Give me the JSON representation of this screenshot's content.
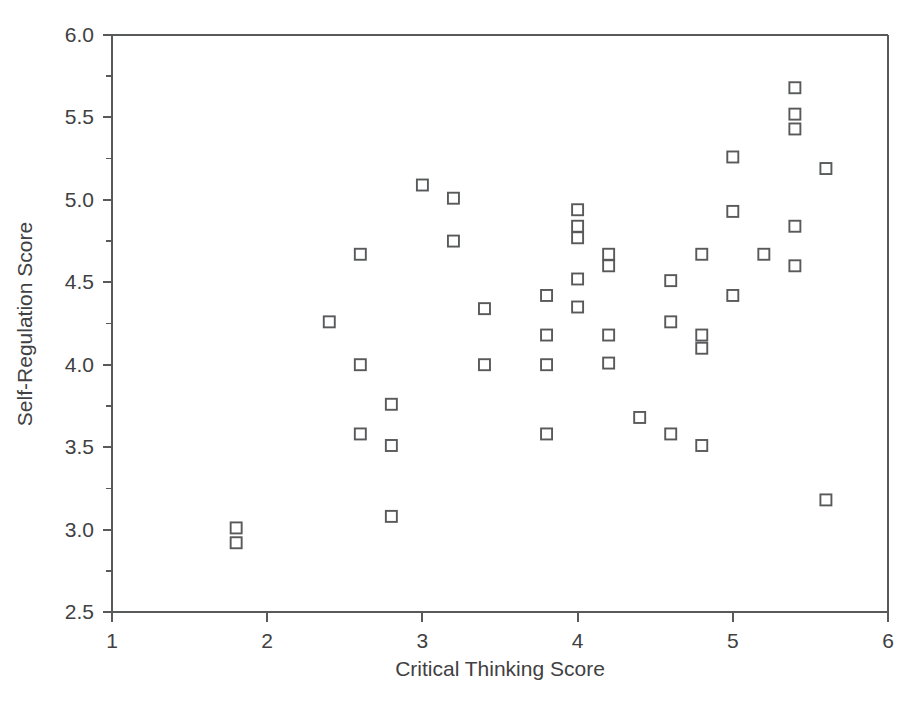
{
  "chart_data": {
    "type": "scatter",
    "title": "",
    "xlabel": "Critical Thinking Score",
    "ylabel": "Self-Regulation Score",
    "xlim": [
      1,
      6
    ],
    "ylim": [
      2.5,
      6.0
    ],
    "x_ticks": [
      "1",
      "2",
      "3",
      "4",
      "5",
      "6"
    ],
    "x_tick_values": [
      1,
      2,
      3,
      4,
      5,
      6
    ],
    "y_ticks": [
      "2.5",
      "3.0",
      "3.5",
      "4.0",
      "4.5",
      "5.0",
      "5.5",
      "6.0"
    ],
    "y_tick_values": [
      2.5,
      3.0,
      3.5,
      4.0,
      4.5,
      5.0,
      5.5,
      6.0
    ],
    "y_minor_tick_values": [
      2.75,
      3.25,
      3.75,
      4.25,
      4.75,
      5.25,
      5.75
    ],
    "grid": false,
    "legend": "none",
    "marker": "open-square",
    "marker_color": "#58595b",
    "marker_fill": "#ffffff",
    "axis_color": "#58595b",
    "point_count": 52,
    "x": [
      1.8,
      1.8,
      2.4,
      2.6,
      2.6,
      2.8,
      2.8,
      2.8,
      3.0,
      3.2,
      3.2,
      3.4,
      3.4,
      3.8,
      3.8,
      3.8,
      3.8,
      4.0,
      4.0,
      4.0,
      4.0,
      4.0,
      4.2,
      4.2,
      4.2,
      4.2,
      4.4,
      4.6,
      4.6,
      4.6,
      4.8,
      4.8,
      4.8,
      4.8,
      5.0,
      5.0,
      5.0,
      5.0,
      5.2,
      5.4,
      5.4,
      5.4,
      5.4,
      5.4,
      5.6,
      5.6
    ],
    "y": [
      3.01,
      2.92,
      4.26,
      4.67,
      4.0,
      3.76,
      3.51,
      3.08,
      5.09,
      5.01,
      4.75,
      4.34,
      4.0,
      4.42,
      4.18,
      4.0,
      3.58,
      4.94,
      4.84,
      4.77,
      4.52,
      4.35,
      4.67,
      4.6,
      4.18,
      4.01,
      3.68,
      4.51,
      4.26,
      3.58,
      4.67,
      4.18,
      4.1,
      3.51,
      5.26,
      4.93,
      4.42,
      4.42,
      4.67,
      5.68,
      5.52,
      5.43,
      4.84,
      4.6,
      5.19,
      3.18
    ],
    "points": [
      [
        1.8,
        3.01
      ],
      [
        1.8,
        2.92
      ],
      [
        2.4,
        4.26
      ],
      [
        2.6,
        4.67
      ],
      [
        2.6,
        4.0
      ],
      [
        2.6,
        3.58
      ],
      [
        2.8,
        3.76
      ],
      [
        2.8,
        3.51
      ],
      [
        2.8,
        3.08
      ],
      [
        3.0,
        5.09
      ],
      [
        3.2,
        5.01
      ],
      [
        3.2,
        4.75
      ],
      [
        3.4,
        4.34
      ],
      [
        3.4,
        4.0
      ],
      [
        3.8,
        4.42
      ],
      [
        3.8,
        4.18
      ],
      [
        3.8,
        4.0
      ],
      [
        3.8,
        3.58
      ],
      [
        4.0,
        4.94
      ],
      [
        4.0,
        4.84
      ],
      [
        4.0,
        4.77
      ],
      [
        4.0,
        4.52
      ],
      [
        4.0,
        4.35
      ],
      [
        4.2,
        4.67
      ],
      [
        4.2,
        4.6
      ],
      [
        4.2,
        4.18
      ],
      [
        4.2,
        4.01
      ],
      [
        4.4,
        3.68
      ],
      [
        4.6,
        4.51
      ],
      [
        4.6,
        4.26
      ],
      [
        4.6,
        3.58
      ],
      [
        4.8,
        4.67
      ],
      [
        4.8,
        4.18
      ],
      [
        4.8,
        4.1
      ],
      [
        4.8,
        3.51
      ],
      [
        5.0,
        5.26
      ],
      [
        5.0,
        4.93
      ],
      [
        5.0,
        4.42
      ],
      [
        5.2,
        4.67
      ],
      [
        5.4,
        5.68
      ],
      [
        5.4,
        5.52
      ],
      [
        5.4,
        5.43
      ],
      [
        5.4,
        4.84
      ],
      [
        5.4,
        4.6
      ],
      [
        5.6,
        5.19
      ],
      [
        5.6,
        3.18
      ]
    ]
  }
}
